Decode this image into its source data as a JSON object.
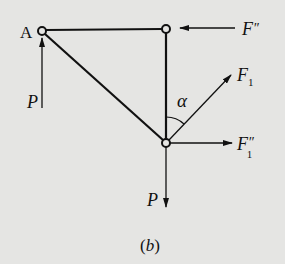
{
  "figure": {
    "caption": "(b)",
    "caption_letter": "b",
    "background": "#e5e5e3",
    "ink": "#111111"
  },
  "nodes": {
    "A": {
      "label": "A",
      "x": 42,
      "y": 31
    },
    "top_right": {
      "x": 166,
      "y": 29
    },
    "bottom": {
      "x": 166,
      "y": 143
    }
  },
  "members": [
    {
      "from": "A",
      "to": "top_right"
    },
    {
      "from": "top_right",
      "to": "bottom"
    },
    {
      "from": "A",
      "to": "bottom"
    }
  ],
  "forces": {
    "F_double_prime": {
      "label": "F",
      "prime": "″",
      "direction": "left"
    },
    "F1": {
      "label": "F",
      "subscript": "1",
      "direction": "up-right"
    },
    "F1_double_prime": {
      "label": "F",
      "prime": "″",
      "subscript": "1",
      "direction": "right"
    },
    "P_at_A": {
      "label": "P",
      "direction": "up"
    },
    "P_at_bottom": {
      "label": "P",
      "direction": "down"
    }
  },
  "angle": {
    "label": "α",
    "between": "vertical member and F1"
  }
}
